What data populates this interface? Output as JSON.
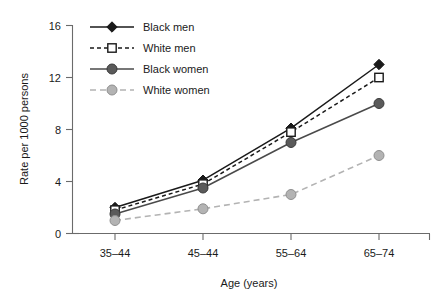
{
  "chart_data": {
    "type": "line",
    "title": "",
    "subtitle": "",
    "xlabel": "Age (years)",
    "ylabel": "Rate per 1000 persons",
    "categories": [
      "35–44",
      "45–44",
      "55–64",
      "65–74"
    ],
    "ylim": [
      0,
      16
    ],
    "yticks": [
      0,
      4,
      8,
      12,
      16
    ],
    "yticklabels": [
      "0",
      "4",
      "8",
      "12",
      "16"
    ],
    "grid": false,
    "legend_position": "top-left-inside",
    "series": [
      {
        "name": "Black men",
        "values": [
          2.0,
          4.1,
          8.1,
          13.0
        ],
        "color": "#1a1a1a",
        "marker": "diamond-filled",
        "linestyle": "solid"
      },
      {
        "name": "White men",
        "values": [
          1.8,
          3.8,
          7.8,
          12.0
        ],
        "color": "#1a1a1a",
        "marker": "square-open",
        "linestyle": "dashed"
      },
      {
        "name": "Black women",
        "values": [
          1.5,
          3.5,
          7.0,
          10.0
        ],
        "color": "#555555",
        "marker": "circle-filled-dark",
        "linestyle": "solid"
      },
      {
        "name": "White women",
        "values": [
          1.0,
          1.9,
          3.0,
          6.0
        ],
        "color": "#a8a8a8",
        "marker": "circle-filled-light",
        "linestyle": "dashed"
      }
    ]
  },
  "legend": {
    "items": [
      {
        "label": "Black men"
      },
      {
        "label": "White men"
      },
      {
        "label": "Black women"
      },
      {
        "label": "White women"
      }
    ]
  },
  "axes": {
    "y_label": "Rate per 1000 persons",
    "x_label": "Age (years)",
    "y_tick_0": "0",
    "y_tick_1": "4",
    "y_tick_2": "8",
    "y_tick_3": "12",
    "y_tick_4": "16",
    "x_tick_0": "35–44",
    "x_tick_1": "45–44",
    "x_tick_2": "55–64",
    "x_tick_3": "65–74"
  }
}
